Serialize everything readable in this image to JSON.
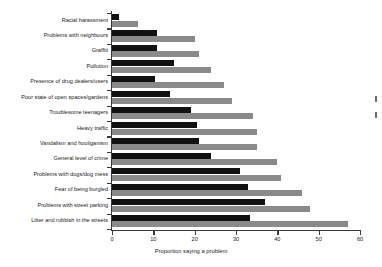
{
  "chart_data": {
    "type": "bar",
    "orientation": "horizontal",
    "title": "",
    "xlabel": "Proportion saying a problem",
    "ylabel": "",
    "xlim": [
      0,
      60
    ],
    "xticks": [
      0,
      10,
      20,
      30,
      40,
      50,
      60
    ],
    "grid": false,
    "legend": null,
    "categories": [
      "Racial harassment",
      "Problems with neighbours",
      "Graffiti",
      "Pollution",
      "Presence of drug dealers/users",
      "Poor state of open spaces/gardens",
      "Troublesome teenagers",
      "Heavy traffic",
      "Vandalism and hooliganism",
      "General level of crime",
      "Problems with dogs/dog mess",
      "Fear of being burgled",
      "Problems with street parking",
      "Litter and rubbish in the streets"
    ],
    "series": [
      {
        "name": "series-dark",
        "color": "#111111",
        "values": [
          1.7,
          11,
          11,
          15,
          10.5,
          14,
          19,
          20.5,
          21,
          24,
          31,
          33,
          37,
          33.5
        ]
      },
      {
        "name": "series-light",
        "color": "#8a8a8a",
        "values": [
          6.3,
          20,
          21,
          24,
          27,
          29,
          34,
          35,
          35,
          40,
          41,
          46,
          48,
          57
        ]
      }
    ]
  }
}
